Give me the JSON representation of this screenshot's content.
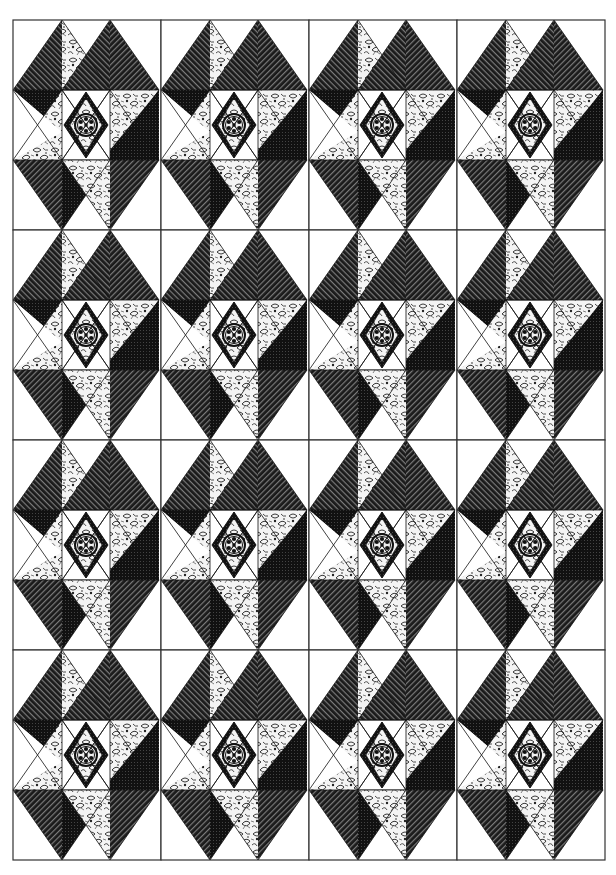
{
  "grid": {
    "rows": 4,
    "cols": 4,
    "x_edges": [
      13,
      161,
      309,
      457,
      605
    ],
    "y_edges": [
      20,
      230,
      440,
      650,
      860
    ]
  },
  "block": {
    "description": "Star block with central medallion diamond, striped dark triangles and floral print triangles",
    "pieces": {
      "stripe_dark": "dark diagonal-stripe fabric",
      "solid_dark": "dark pin-dot fabric",
      "floral": "black and white floral print",
      "plain": "white background",
      "medallion": "center rosette diamond"
    }
  },
  "colors": {
    "background": "#ffffff",
    "ink": "#111111",
    "stripe_light": "#6a6a6a",
    "outline": "#333333"
  }
}
